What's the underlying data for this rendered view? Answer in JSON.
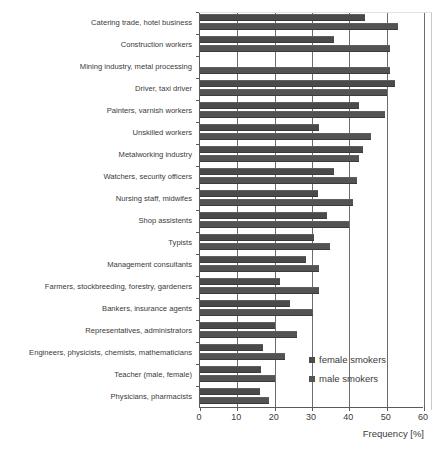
{
  "chart_data": {
    "type": "bar",
    "orientation": "horizontal",
    "title": "",
    "xlabel": "Frequency [%]",
    "ylabel": "",
    "xlim": [
      0,
      60
    ],
    "xticks": [
      0,
      10,
      20,
      30,
      40,
      50,
      60
    ],
    "grid": true,
    "legend_position": "inside-right-lower",
    "categories": [
      "Catering trade, hotel business",
      "Construction workers",
      "Mining industry, metal processing",
      "Driver, taxi driver",
      "Painters, varnish workers",
      "Unskilled workers",
      "Metalworking industry",
      "Watchers, security officers",
      "Nursing staff, midwifes",
      "Shop assistents",
      "Typists",
      "Management consultants",
      "Farmers, stockbreeding, forestry, gardeners",
      "Bankers, insurance agents",
      "Representatives, administrators",
      "Engineers, physicists, chemists, mathematicians",
      "Teacher (male, female)",
      "Physicians, pharmacists"
    ],
    "series": [
      {
        "name": "female smokers",
        "color": "#4a4a4a",
        "values": [
          44.3,
          36.0,
          0.0,
          52.3,
          42.5,
          32.0,
          43.6,
          36.0,
          31.5,
          34.0,
          30.5,
          28.4,
          21.3,
          24.2,
          20.0,
          16.8,
          16.4,
          16.2
        ]
      },
      {
        "name": "male smokers",
        "color": "#535353",
        "values": [
          53.0,
          51.0,
          51.0,
          50.0,
          49.6,
          45.8,
          42.5,
          42.0,
          41.0,
          40.0,
          34.7,
          32.0,
          31.8,
          30.2,
          26.0,
          22.9,
          20.0,
          18.4
        ]
      }
    ]
  },
  "legend": {
    "items": [
      {
        "label": "female smokers",
        "swatch": "female"
      },
      {
        "label": "male smokers",
        "swatch": "male"
      }
    ]
  },
  "axis": {
    "x_title": "Frequency [%]"
  }
}
